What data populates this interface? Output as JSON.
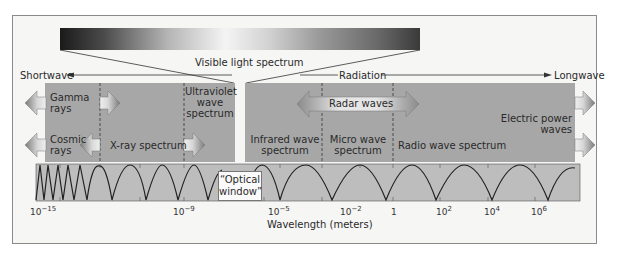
{
  "diagram": {
    "type": "electromagnetic-spectrum",
    "top_bar_label": "Visible light spectrum",
    "direction": {
      "left": "Shortwave",
      "center": "Radiation",
      "right": "Longwave"
    },
    "left_panel": {
      "regions": [
        {
          "label_line1": "Gamma",
          "label_line2": "rays"
        },
        {
          "label_line1": "Cosmic",
          "label_line2": "rays"
        },
        {
          "label_line1": "X-ray spectrum"
        },
        {
          "label_line1": "Ultraviolet",
          "label_line2": "wave",
          "label_line3": "spectrum"
        }
      ]
    },
    "right_panel": {
      "radar_label": "Radar waves",
      "regions": [
        {
          "label_line1": "Infrared wave",
          "label_line2": "spectrum"
        },
        {
          "label_line1": "Micro wave",
          "label_line2": "spectrum"
        },
        {
          "label_line1": "Radio wave spectrum"
        },
        {
          "label_line1": "Electric power",
          "label_line2": "waves"
        }
      ]
    },
    "optical_window": {
      "line1": "“Optical",
      "line2": "window”"
    },
    "axis": {
      "label": "Wavelength (meters)",
      "ticks": [
        {
          "base": "10",
          "exp": "−15"
        },
        {
          "base": "10",
          "exp": "−9"
        },
        {
          "base": "10",
          "exp": "−5"
        },
        {
          "base": "10",
          "exp": "−2"
        },
        {
          "base": "1",
          "exp": ""
        },
        {
          "base": "10",
          "exp": "2"
        },
        {
          "base": "10",
          "exp": "4"
        },
        {
          "base": "10",
          "exp": "6"
        }
      ]
    },
    "colors": {
      "panel": "#a7a7a7",
      "wave_strip": "#bdbdbd",
      "frame_bg": "#f6f6f5",
      "line": "#2a2a2a"
    }
  }
}
